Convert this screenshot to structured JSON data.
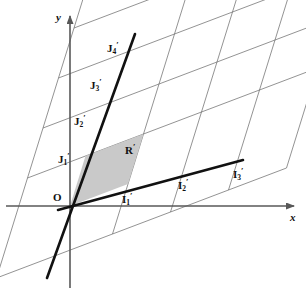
{
  "figure": {
    "type": "geometry-diagram",
    "title": "",
    "background": "#ffffff",
    "shade_color": "#c9c9c9",
    "thin_line_color": "#6f6f6f",
    "thick_line_color": "#111111",
    "axis_color": "#585858"
  },
  "axes": {
    "x_label": "x",
    "y_label": "y",
    "origin_label": "O",
    "origin_px": {
      "x": 70,
      "y": 206
    },
    "x_axis": {
      "x1": 6,
      "y1": 206,
      "x2": 294,
      "y2": 206
    },
    "y_axis": {
      "x1": 70,
      "y1": 288,
      "x2": 70,
      "y2": 16
    }
  },
  "lattice": {
    "basis_i_px": {
      "dx": 58,
      "dy": -22
    },
    "basis_j_px": {
      "dx": 15.5,
      "dy": -50
    },
    "i_range": [
      -1,
      4
    ],
    "j_range": [
      -1,
      5
    ]
  },
  "labels": {
    "origin": {
      "text": "O",
      "x": 53,
      "y": 192
    },
    "i_axis_points": [
      {
        "name": "I'1",
        "base": "I",
        "sub": "1",
        "prime": "′",
        "x": 122,
        "y": 192
      },
      {
        "name": "I'2",
        "base": "I",
        "sub": "2",
        "prime": "′",
        "x": 178,
        "y": 178
      },
      {
        "name": "I'3",
        "base": "I",
        "sub": "3",
        "prime": "′",
        "x": 233,
        "y": 167
      }
    ],
    "j_axis_points": [
      {
        "name": "J'1",
        "base": "J",
        "sub": "1",
        "prime": "′",
        "x": 58,
        "y": 152
      },
      {
        "name": "J'2",
        "base": "J",
        "sub": "2",
        "prime": "′",
        "x": 74,
        "y": 114
      },
      {
        "name": "J'3",
        "base": "J",
        "sub": "3",
        "prime": "′",
        "x": 90,
        "y": 78
      },
      {
        "name": "J'4",
        "base": "J",
        "sub": "4",
        "prime": "′",
        "x": 107,
        "y": 41
      }
    ],
    "region": {
      "name": "R'",
      "base": "R",
      "sub": "",
      "prime": "′",
      "x": 125,
      "y": 143
    }
  },
  "shaded_region": {
    "name": "unit-cell",
    "vertices": [
      {
        "x": 70,
        "y": 206
      },
      {
        "x": 128,
        "y": 184
      },
      {
        "x": 143.5,
        "y": 134
      },
      {
        "x": 85.5,
        "y": 156
      }
    ]
  },
  "thick_lines": [
    {
      "name": "i-axis-image",
      "x1": 58,
      "y1": 210,
      "x2": 243,
      "y2": 160
    },
    {
      "name": "j-axis-image",
      "x1": 47,
      "y1": 278,
      "x2": 135,
      "y2": 34
    }
  ]
}
